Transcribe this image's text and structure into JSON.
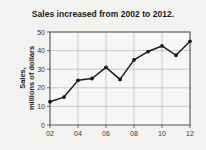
{
  "chart_data": {
    "type": "line",
    "title": "Sales increased from 2002 to 2012.",
    "xlabel": "",
    "ylabel": "Sales, millions of dollars",
    "ylabel_lines": [
      "Sales,",
      "millions of dollars"
    ],
    "x": [
      2002,
      2003,
      2004,
      2005,
      2006,
      2007,
      2008,
      2009,
      2010,
      2011,
      2012
    ],
    "xtick_values": [
      2002,
      2004,
      2006,
      2008,
      2010,
      2012
    ],
    "xtick_labels": [
      "02",
      "04",
      "06",
      "08",
      "10",
      "12"
    ],
    "ytick_values": [
      0,
      10,
      20,
      30,
      40,
      50
    ],
    "ytick_labels": [
      "0",
      "10",
      "20",
      "30",
      "40",
      "50"
    ],
    "values": [
      12.5,
      15,
      24,
      25,
      31,
      24.5,
      35,
      39.5,
      42.5,
      37.5,
      45
    ],
    "xlim": [
      2002,
      2012
    ],
    "ylim": [
      0,
      50
    ],
    "grid": true,
    "legend": "none",
    "marker": "circle",
    "line_color": "#1a1a1a",
    "marker_color": "#1a1a1a",
    "grid_color": "#b9b9bd",
    "axis_color": "#555555",
    "background_color": "#f2f2f0",
    "plot_background_color": "#f6f6f4"
  }
}
